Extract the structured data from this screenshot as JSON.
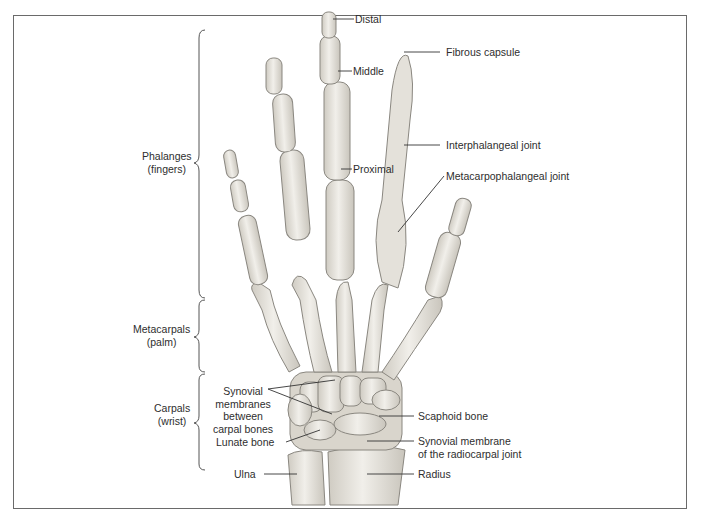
{
  "figure": {
    "regions": [
      {
        "id": "phalanges",
        "line1": "Phalanges",
        "line2": "(fingers)"
      },
      {
        "id": "metacarpals",
        "line1": "Metacarpals",
        "line2": "(palm)"
      },
      {
        "id": "carpals",
        "line1": "Carpals",
        "line2": "(wrist)"
      }
    ],
    "labels_left": {
      "synovial_membranes": [
        "Synovial",
        "membranes",
        "between",
        "carpal bones"
      ],
      "lunate": "Lunate bone",
      "ulna": "Ulna"
    },
    "labels_finger": {
      "distal": "Distal",
      "middle": "Middle",
      "proximal": "Proximal"
    },
    "labels_right": {
      "fibrous_capsule": "Fibrous capsule",
      "interphalangeal": "Interphalangeal joint",
      "metacarpophalangeal": "Metacarpophalangeal joint",
      "scaphoid": "Scaphoid bone",
      "radiocarpal_line1": "Synovial membrane",
      "radiocarpal_line2": "of the radiocarpal joint",
      "radius": "Radius"
    },
    "colors": {
      "border": "#6a6a6a",
      "text": "#2e2e2e",
      "bone_fill": "#e6e3dc",
      "bone_stroke": "#8a8780",
      "leader": "#333333"
    }
  }
}
